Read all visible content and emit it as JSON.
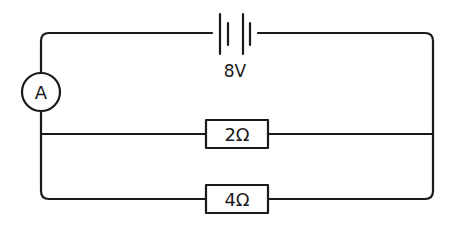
{
  "diagram": {
    "type": "circuit",
    "battery": {
      "label": "8V"
    },
    "ammeter": {
      "label": "A"
    },
    "resistors": [
      {
        "label": "2Ω"
      },
      {
        "label": "4Ω"
      }
    ],
    "colors": {
      "stroke": "#1a1a1a",
      "background": "#ffffff"
    }
  }
}
